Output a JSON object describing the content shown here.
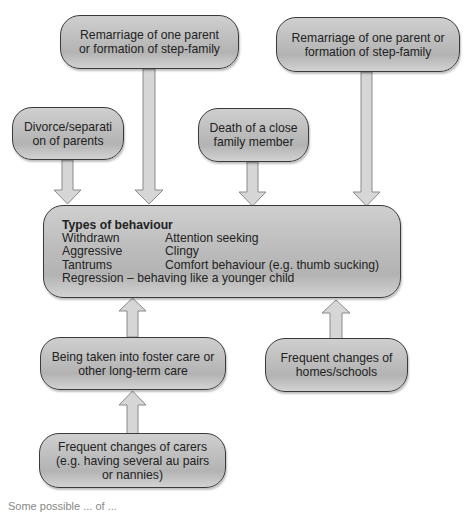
{
  "diagram": {
    "causes": [
      {
        "id": "remarriage-1",
        "lines": [
          "Remarriage of one parent",
          "or formation of step-family"
        ]
      },
      {
        "id": "remarriage-2",
        "lines": [
          "Remarriage of one parent or",
          "formation of step-family"
        ]
      },
      {
        "id": "divorce",
        "lines": [
          "Divorce/separati",
          "on of parents"
        ]
      },
      {
        "id": "death",
        "lines": [
          "Death of a close",
          "family member"
        ]
      },
      {
        "id": "foster-care",
        "lines": [
          "Being taken into foster care or",
          "other long-term care"
        ]
      },
      {
        "id": "homes-schools",
        "lines": [
          "Frequent changes of",
          "homes/schools"
        ]
      },
      {
        "id": "carers",
        "lines": [
          "Frequent changes of carers",
          "(e.g. having several au pairs",
          "or nannies)"
        ]
      }
    ],
    "behaviour": {
      "title": "Types of behaviour",
      "rows": [
        [
          "Withdrawn",
          "Attention seeking"
        ],
        [
          "Aggressive",
          "Clingy"
        ],
        [
          "Tantrums",
          "Comfort behaviour (e.g. thumb sucking)"
        ]
      ],
      "last_line": "Regression – behaving like a younger child"
    },
    "edges": [
      {
        "from": "divorce",
        "to": "behaviour"
      },
      {
        "from": "remarriage-1",
        "to": "behaviour"
      },
      {
        "from": "death",
        "to": "behaviour"
      },
      {
        "from": "remarriage-2",
        "to": "behaviour"
      },
      {
        "from": "foster-care",
        "to": "behaviour"
      },
      {
        "from": "homes-schools",
        "to": "behaviour"
      },
      {
        "from": "carers",
        "to": "foster-care"
      }
    ],
    "caption": "Some possible ... of ..."
  },
  "colors": {
    "box_fill": "#bdbdbd",
    "box_border": "#3a3a3a",
    "arrow_fill": "#d4d4d4",
    "arrow_stroke": "#8a8a8a"
  }
}
